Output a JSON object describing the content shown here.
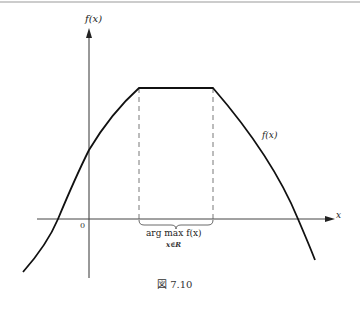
{
  "figure": {
    "caption": "図 7.10",
    "y_axis_label": "f(x)",
    "x_axis_label": "x",
    "origin_label": "0",
    "curve_label": "f(x)",
    "argmax_label": "arg max f(x)",
    "argmax_subscript": "x∈R"
  },
  "colors": {
    "line": "#111111",
    "dashed": "#555555",
    "axis": "#333333"
  }
}
